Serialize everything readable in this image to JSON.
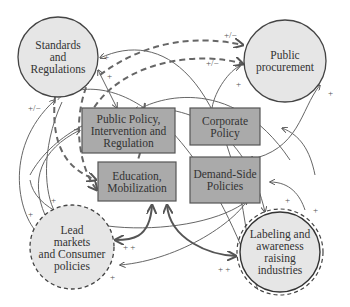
{
  "colors": {
    "circle_fill": "#e6e6e6",
    "box_fill": "#aaaaaa",
    "stroke": "#444444",
    "arrow": "#555555",
    "background": "#ffffff"
  },
  "nodes": {
    "standards": {
      "label": "Standards and Regulations",
      "lines": [
        "Standards",
        "and",
        "Regulations"
      ],
      "shape": "circle",
      "border": "solid"
    },
    "procurement": {
      "label": "Public procurement",
      "lines": [
        "Public",
        "procurement"
      ],
      "shape": "circle",
      "border": "solid"
    },
    "public_policy": {
      "label": "Public Policy, Intervention and Regulation",
      "lines": [
        "Public Policy,",
        "Intervention and",
        "Regulation"
      ],
      "shape": "box"
    },
    "corporate": {
      "label": "Corporate Policy",
      "lines": [
        "Corporate",
        "Policy"
      ],
      "shape": "box"
    },
    "education": {
      "label": "Education, Mobilization",
      "lines": [
        "Education,",
        "Mobilization"
      ],
      "shape": "box"
    },
    "demand": {
      "label": "Demand-Side Policies",
      "lines": [
        "Demand-Side",
        "Policies"
      ],
      "shape": "box"
    },
    "lead_markets": {
      "label": "Lead markets and Consumer policies",
      "lines": [
        "Lead",
        "markets",
        "and Consumer",
        "policies"
      ],
      "shape": "circle",
      "border": "dashed"
    },
    "labeling": {
      "label": "Labeling and awareness raising industries",
      "lines": [
        "Labeling and",
        "awareness",
        "raising",
        "industries"
      ],
      "shape": "circle",
      "border": "double-dashed"
    }
  },
  "signs": [
    {
      "text": "+",
      "x": 104,
      "y": 53
    },
    {
      "text": "+",
      "x": 107,
      "y": 72
    },
    {
      "text": "+/−",
      "x": 28,
      "y": 108
    },
    {
      "text": "+/−",
      "x": 226,
      "y": 31
    },
    {
      "text": "+/−",
      "x": 206,
      "y": 59
    },
    {
      "text": "+",
      "x": 236,
      "y": 80
    },
    {
      "text": "+",
      "x": 328,
      "y": 89
    },
    {
      "text": "+",
      "x": 51,
      "y": 196
    },
    {
      "text": "+",
      "x": 28,
      "y": 213
    },
    {
      "text": "+ +",
      "x": 123,
      "y": 246
    },
    {
      "text": "+",
      "x": 110,
      "y": 275
    },
    {
      "text": "+ +",
      "x": 218,
      "y": 265
    },
    {
      "text": "+",
      "x": 285,
      "y": 196
    },
    {
      "text": "+",
      "x": 313,
      "y": 206
    }
  ]
}
